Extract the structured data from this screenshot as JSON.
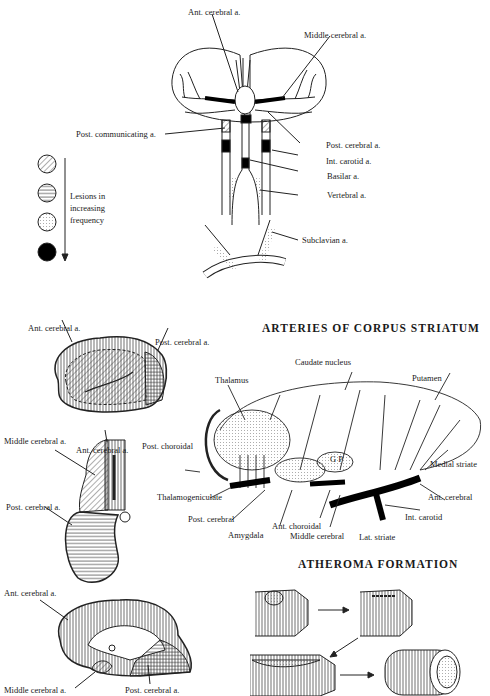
{
  "top_diagram": {
    "name": "Circle of Willis and extracranial arteries",
    "labels": {
      "ant_cerebral": "Ant. cerebral a.",
      "middle_cerebral": "Middle cerebral a.",
      "post_communicating": "Post. communicating a.",
      "post_cerebral": "Post. cerebral a.",
      "int_carotid": "Int. carotid a.",
      "basilar": "Basilar a.",
      "vertebral": "Vertebral a.",
      "subclavian": "Subclavian a."
    },
    "legend": {
      "text_lines": [
        "Lesions in",
        "increasing",
        "frequency"
      ],
      "items": [
        {
          "pattern": "diagonal-hatch"
        },
        {
          "pattern": "horizontal-lines"
        },
        {
          "pattern": "stippled"
        },
        {
          "pattern": "solid-black"
        }
      ]
    }
  },
  "territory_diagrams": {
    "lateral": {
      "ant_cerebral": "Ant. cerebral a.",
      "post_cerebral": "Post. cerebral a."
    },
    "coronal": {
      "middle_cerebral": "Middle cerebral a.",
      "ant_cerebral": "Ant. cerebral a.",
      "post_cerebral": "Post. cerebral a."
    },
    "medial": {
      "ant_cerebral": "Ant. cerebral a.",
      "middle_cerebral": "Middle cerebral a.",
      "post_cerebral": "Post. cerebral a."
    }
  },
  "corpus_striatum": {
    "title": "ARTERIES OF CORPUS STRIATUM",
    "labels": {
      "caudate": "Caudate nucleus",
      "thalamus": "Thalamus",
      "putamen": "Putamen",
      "post_choroidal": "Post. choroidal",
      "gp": "G P",
      "medial_striate": "Medial striate",
      "thalamogeniculate": "Thalamogeniculate",
      "ant_cerebral": "Ant. cerebral",
      "post_cerebral": "Post. cerebral",
      "int_carotid": "Int. carotid",
      "amygdala": "Amygdala",
      "ant_choroidal": "Ant. choroidal",
      "middle_cerebral": "Middle cerebral",
      "lat_striate": "Lat. striate"
    }
  },
  "atheroma": {
    "title": "ATHEROMA FORMATION"
  }
}
